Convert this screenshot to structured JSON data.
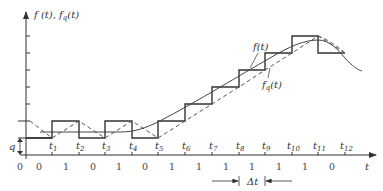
{
  "diagram": {
    "y_axis_label": "f (t), f",
    "y_axis_label_sub": "q",
    "y_axis_label_end": "(t)",
    "x_axis_label": "t",
    "origin_label": "0",
    "step_label": "q",
    "curve_labels": {
      "f": "f(t)",
      "fq_main": "f",
      "fq_sub": "q",
      "fq_end": "(t)"
    },
    "delta_t_label": "Δt",
    "time_ticks": [
      "t1",
      "t2",
      "t3",
      "t4",
      "t5",
      "t6",
      "t7",
      "t8",
      "t9",
      "t10",
      "t11",
      "t12"
    ],
    "time_tick_parts": [
      {
        "t": "t",
        "s": "1"
      },
      {
        "t": "t",
        "s": "2"
      },
      {
        "t": "t",
        "s": "3"
      },
      {
        "t": "t",
        "s": "4"
      },
      {
        "t": "t",
        "s": "5"
      },
      {
        "t": "t",
        "s": "6"
      },
      {
        "t": "t",
        "s": "7"
      },
      {
        "t": "t",
        "s": "8"
      },
      {
        "t": "t",
        "s": "9"
      },
      {
        "t": "t",
        "s": "10"
      },
      {
        "t": "t",
        "s": "11"
      },
      {
        "t": "t",
        "s": "12"
      }
    ],
    "bits": [
      "0",
      "0",
      "1",
      "0",
      "1",
      "0",
      "1",
      "1",
      "1",
      "1",
      "1",
      "1",
      "0"
    ],
    "colors": {
      "line": "#333333",
      "curve": "#444444",
      "dashed": "#555555"
    }
  }
}
